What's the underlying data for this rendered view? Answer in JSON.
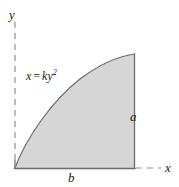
{
  "figure": {
    "background_color": "#ffffff",
    "width": 179,
    "height": 187,
    "region": {
      "fill_color": "#d6d6d6",
      "stroke_color": "#6e6e6e",
      "description": "shaded parabolic spandrel region"
    },
    "axes": {
      "style": "dashed",
      "color": "#8a8a8a",
      "y_axis": {
        "label": "y",
        "x": 15,
        "y_start": 22,
        "y_end": 168
      },
      "x_axis": {
        "label": "x",
        "y": 168,
        "x_start": 135,
        "x_end": 161
      }
    },
    "curve": {
      "equation_label": "x = ky",
      "equation_variable_x": "x",
      "equation_operator": "=",
      "equation_coefficient": "k",
      "equation_variable_y": "y",
      "equation_exponent": "2",
      "origin": {
        "x": 15,
        "y": 168
      },
      "apex": {
        "x": 135,
        "y": 54
      },
      "type": "parabola-right-opening"
    },
    "dimensions": {
      "vertical_label": "a",
      "horizontal_label": "b",
      "vertical_edge": {
        "x": 134,
        "y_top": 54,
        "y_bottom": 168
      },
      "horizontal_edge": {
        "y": 168,
        "x_left": 15,
        "x_right": 134
      }
    }
  }
}
